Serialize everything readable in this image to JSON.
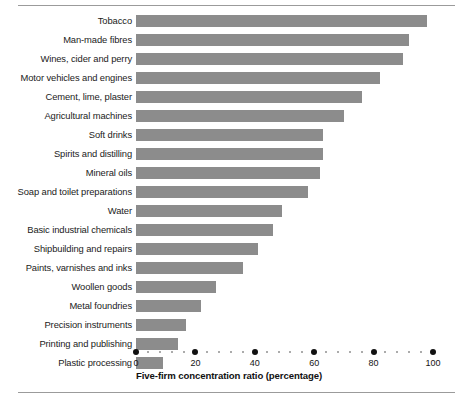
{
  "chart_data": {
    "type": "bar",
    "orientation": "horizontal",
    "title": "",
    "xlabel": "Five-firm concentration ratio (percentage)",
    "ylabel": "",
    "xlim": [
      0,
      100
    ],
    "xticks": [
      0,
      20,
      40,
      60,
      80,
      100
    ],
    "xtick_labels": [
      "0",
      "20",
      "40",
      "60",
      "80",
      "100"
    ],
    "minor_tick_step": 4,
    "grid": false,
    "legend": null,
    "bar_color": "#8c8c8c",
    "categories": [
      "Tobacco",
      "Man-made fibres",
      "Wines, cider and perry",
      "Motor vehicles and engines",
      "Cement, lime, plaster",
      "Agricultural machines",
      "Soft drinks",
      "Spirits and distilling",
      "Mineral oils",
      "Soap and toilet preparations",
      "Water",
      "Basic industrial chemicals",
      "Shipbuilding and repairs",
      "Paints, varnishes and inks",
      "Woollen goods",
      "Metal foundries",
      "Precision instruments",
      "Printing and publishing",
      "Plastic processing"
    ],
    "values": [
      98,
      92,
      90,
      82,
      76,
      70,
      63,
      63,
      62,
      58,
      49,
      46,
      41,
      36,
      27,
      22,
      17,
      14,
      9
    ]
  }
}
